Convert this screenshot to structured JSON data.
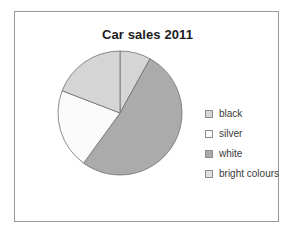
{
  "figure": {
    "background_color": "#ffffff",
    "frame_border_color": "#9a9a9a"
  },
  "title": "Car sales 2011",
  "legend": {
    "position": "right",
    "entries": [
      {
        "label": "black",
        "swatch_color": "#d5d5d5",
        "icon": "legend-swatch-icon"
      },
      {
        "label": "silver",
        "swatch_color": "#fbfbfb",
        "icon": "legend-swatch-icon"
      },
      {
        "label": "white",
        "swatch_color": "#ababab",
        "icon": "legend-swatch-icon"
      },
      {
        "label": "bright colours",
        "swatch_color": "#e0e0e0",
        "icon": "legend-swatch-icon"
      }
    ]
  },
  "chart_data": {
    "type": "pie",
    "title": "Car sales 2011",
    "xlabel": "",
    "ylabel": "",
    "start_angle_deg": 90,
    "direction": "clockwise",
    "grid": false,
    "legend_position": "right",
    "categories": [
      "black",
      "silver",
      "white",
      "bright colours"
    ],
    "values": [
      8,
      21,
      52,
      19
    ],
    "value_unit": "percent",
    "slices": [
      {
        "label": "black",
        "value": 8,
        "color": "#d5d5d5",
        "edge_color": "#6e6e6e",
        "start_deg": 0,
        "end_deg": 29
      },
      {
        "label": "white",
        "value": 52,
        "color": "#ababab",
        "edge_color": "#6e6e6e",
        "start_deg": 29,
        "end_deg": 216
      },
      {
        "label": "silver",
        "value": 21,
        "color": "#fbfbfb",
        "edge_color": "#6e6e6e",
        "start_deg": 216,
        "end_deg": 291
      },
      {
        "label": "bright colours",
        "value": 19,
        "color": "#d5d5d5",
        "edge_color": "#6e6e6e",
        "start_deg": 291,
        "end_deg": 360
      }
    ]
  }
}
